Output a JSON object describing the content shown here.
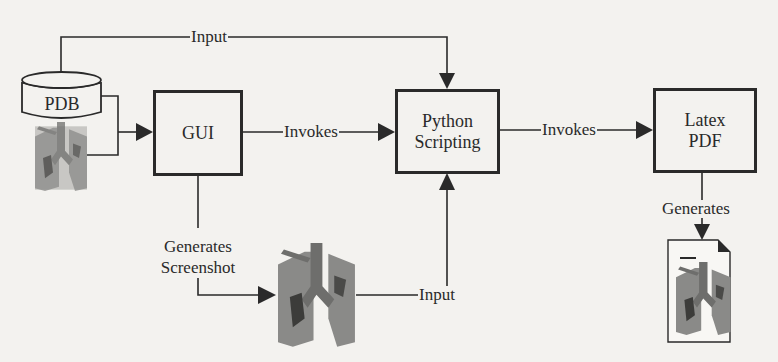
{
  "diagram": {
    "nodes": {
      "pdb": {
        "label": "PDB",
        "shape": "database-cylinder"
      },
      "gui": {
        "label": "GUI",
        "shape": "box"
      },
      "python": {
        "line1": "Python",
        "line2": "Scripting",
        "shape": "box"
      },
      "latex": {
        "line1": "Latex",
        "line2": "PDF",
        "shape": "box"
      },
      "screenshot_image": {
        "shape": "lung-render-image"
      },
      "pdb_image": {
        "shape": "lung-render-image"
      },
      "pdf_document": {
        "shape": "document-icon-with-lung-image"
      }
    },
    "edges": {
      "pdb_to_python": {
        "label": "Input"
      },
      "pdb_to_gui": {
        "label": ""
      },
      "gui_to_python": {
        "label": "Invokes"
      },
      "python_to_latex": {
        "label": "Invokes"
      },
      "latex_to_document": {
        "label": "Generates"
      },
      "gui_to_screenshot": {
        "line1": "Generates",
        "line2": "Screenshot"
      },
      "screenshot_to_python": {
        "label": "Input"
      }
    },
    "colors": {
      "ink": "#2a2a2a",
      "paper": "#f3f2ef",
      "lung": "#7a7a78",
      "lung_dark": "#3c3c3a"
    }
  }
}
